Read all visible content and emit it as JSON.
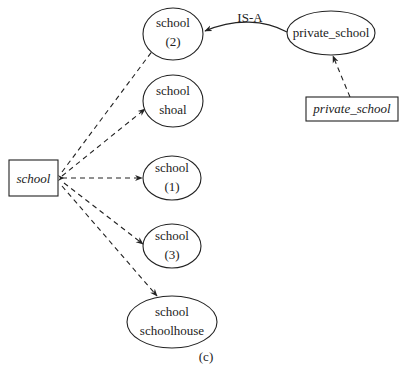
{
  "diagram": {
    "caption": "(c)",
    "source_box": {
      "label": "school"
    },
    "concept_nodes": [
      {
        "id": "school-2",
        "line1": "school",
        "line2": "(2)"
      },
      {
        "id": "school-shoal",
        "line1": "school",
        "line2": "shoal"
      },
      {
        "id": "school-1",
        "line1": "school",
        "line2": "(1)"
      },
      {
        "id": "school-3",
        "line1": "school",
        "line2": "(3)"
      },
      {
        "id": "school-schoolhouse",
        "line1": "school",
        "line2": "schoolhouse"
      }
    ],
    "private_node": {
      "label": "private_school"
    },
    "private_box": {
      "label": "private_school"
    },
    "edge_label": "IS-A",
    "edges": [
      {
        "from": "school (box)",
        "to": "school (2)",
        "style": "dashed"
      },
      {
        "from": "school (box)",
        "to": "school shoal",
        "style": "dashed"
      },
      {
        "from": "school (box)",
        "to": "school (1)",
        "style": "dashed"
      },
      {
        "from": "school (box)",
        "to": "school (3)",
        "style": "dashed"
      },
      {
        "from": "school (box)",
        "to": "school schoolhouse",
        "style": "dashed"
      },
      {
        "from": "private_school (box)",
        "to": "private_school (node)",
        "style": "dashed"
      },
      {
        "from": "private_school (node)",
        "to": "school (2)",
        "style": "solid",
        "label": "IS-A"
      }
    ]
  }
}
